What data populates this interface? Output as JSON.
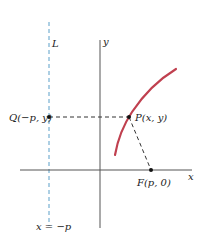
{
  "diagram": {
    "type": "parabola-definition",
    "labels": {
      "directrix": "L",
      "y_axis": "y",
      "x_axis": "x",
      "point_q": "Q(−p, y)",
      "point_p": "P(x, y)",
      "point_f": "F(p, 0)",
      "directrix_eq": "x = −p"
    },
    "colors": {
      "curve": "#c0404f",
      "directrix": "#5a9fc8",
      "axes": "#555555",
      "dashed": "#333333",
      "point": "#111111"
    }
  }
}
